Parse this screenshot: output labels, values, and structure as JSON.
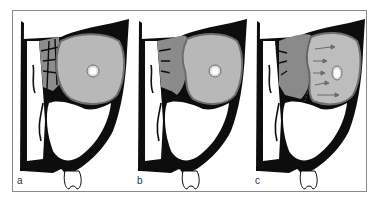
{
  "figure": {
    "panels": [
      {
        "label": "a",
        "state": "subperiosteal-thin"
      },
      {
        "label": "b",
        "state": "subperiosteal-abscess"
      },
      {
        "label": "c",
        "state": "orbital-spread"
      }
    ]
  },
  "colors": {
    "bone": "#0d0d0d",
    "orbit_fill": "#b8b8b8",
    "orbit_rim": "#6e6e6e",
    "ethmoid_fill": "#8c8c8c",
    "abscess_fill": "#8a8a8a",
    "background": "#ffffff",
    "frame": "#8a8a8a",
    "arrow": "#6a6a6a"
  }
}
